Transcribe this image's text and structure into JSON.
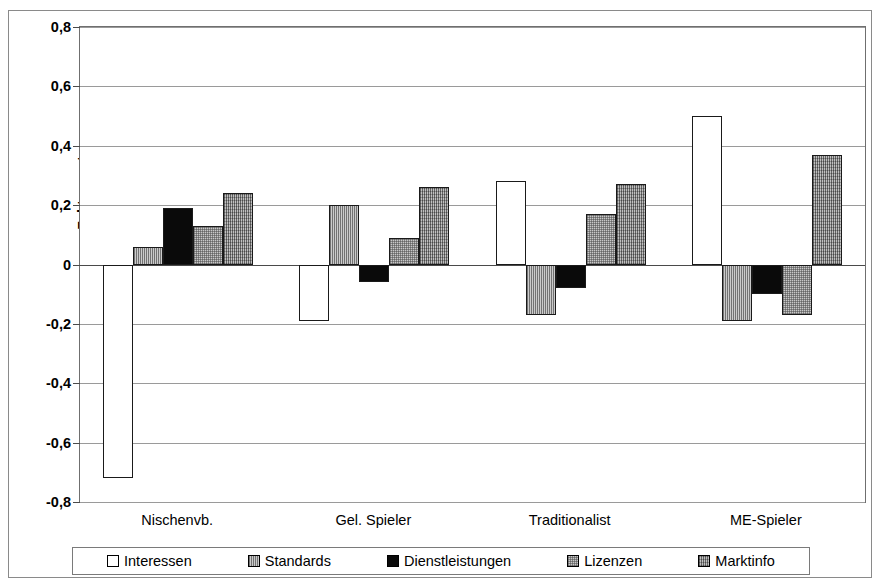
{
  "chart_data": {
    "type": "bar",
    "title": "",
    "subtitle": "",
    "xlabel": "",
    "ylabel": "Faktorwerte",
    "ylim": [
      -0.8,
      0.8
    ],
    "ytick_values": [
      0.8,
      0.6,
      0.4,
      0.2,
      0,
      -0.2,
      -0.4,
      -0.6,
      -0.8
    ],
    "ytick_labels": [
      "0,8",
      "0,6",
      "0,4",
      "0,2",
      "0",
      "-0,2",
      "-0,4",
      "-0,6",
      "-0,8"
    ],
    "grid": true,
    "legend_position": "bottom",
    "categories": [
      "Nischenvb.",
      "Gel. Spieler",
      "Traditionalist",
      "ME-Spieler"
    ],
    "series": [
      {
        "name": "Interessen",
        "pattern": "white",
        "values": [
          -0.72,
          -0.19,
          0.28,
          0.5
        ]
      },
      {
        "name": "Standards",
        "pattern": "vertical-lines",
        "values": [
          0.06,
          0.2,
          -0.17,
          -0.19
        ]
      },
      {
        "name": "Dienstleistungen",
        "pattern": "solid-black",
        "values": [
          0.19,
          -0.06,
          -0.08,
          -0.1
        ]
      },
      {
        "name": "Lizenzen",
        "pattern": "fine-grid",
        "values": [
          0.13,
          0.09,
          0.17,
          -0.17
        ]
      },
      {
        "name": "Marktinfo",
        "pattern": "cross-hatch",
        "values": [
          0.24,
          0.26,
          0.27,
          0.37
        ]
      }
    ],
    "colors": {
      "interessen": "#ffffff",
      "standards": "#b4b4b4",
      "dienstleistungen": "#0a0a0a",
      "lizenzen": "#c8c8c8",
      "marktinfo": "#a5a5a5",
      "gridline": "#9a9a9a",
      "axis": "#4a4a4a",
      "border": "#1a1a1a"
    }
  }
}
